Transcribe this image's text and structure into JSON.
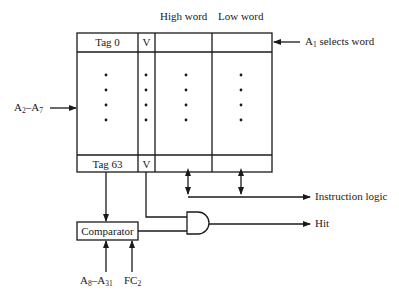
{
  "diagram": {
    "header_labels": {
      "high_word": "High word",
      "low_word": "Low word"
    },
    "table": {
      "top_row": {
        "tag": "Tag 0",
        "valid": "V"
      },
      "bottom_row": {
        "tag": "Tag 63",
        "valid": "V"
      },
      "columns": [
        "Tag",
        "V",
        "High word",
        "Low word"
      ],
      "ellipsis": "•"
    },
    "inputs": {
      "index": {
        "base": "A",
        "sub1": "2",
        "dash": "–",
        "base2": "A",
        "sub2": "7"
      },
      "word_select": {
        "base": "A",
        "sub": "1",
        "text": " selects word"
      },
      "tag_compare": {
        "base": "A",
        "sub1": "8",
        "dash": "–",
        "base2": "A",
        "sub2": "31"
      },
      "function_code": {
        "base": "FC",
        "sub": "2"
      }
    },
    "blocks": {
      "comparator": "Comparator",
      "and_gate": "AND"
    },
    "outputs": {
      "instruction_logic": "Instruction logic",
      "hit": "Hit"
    }
  }
}
